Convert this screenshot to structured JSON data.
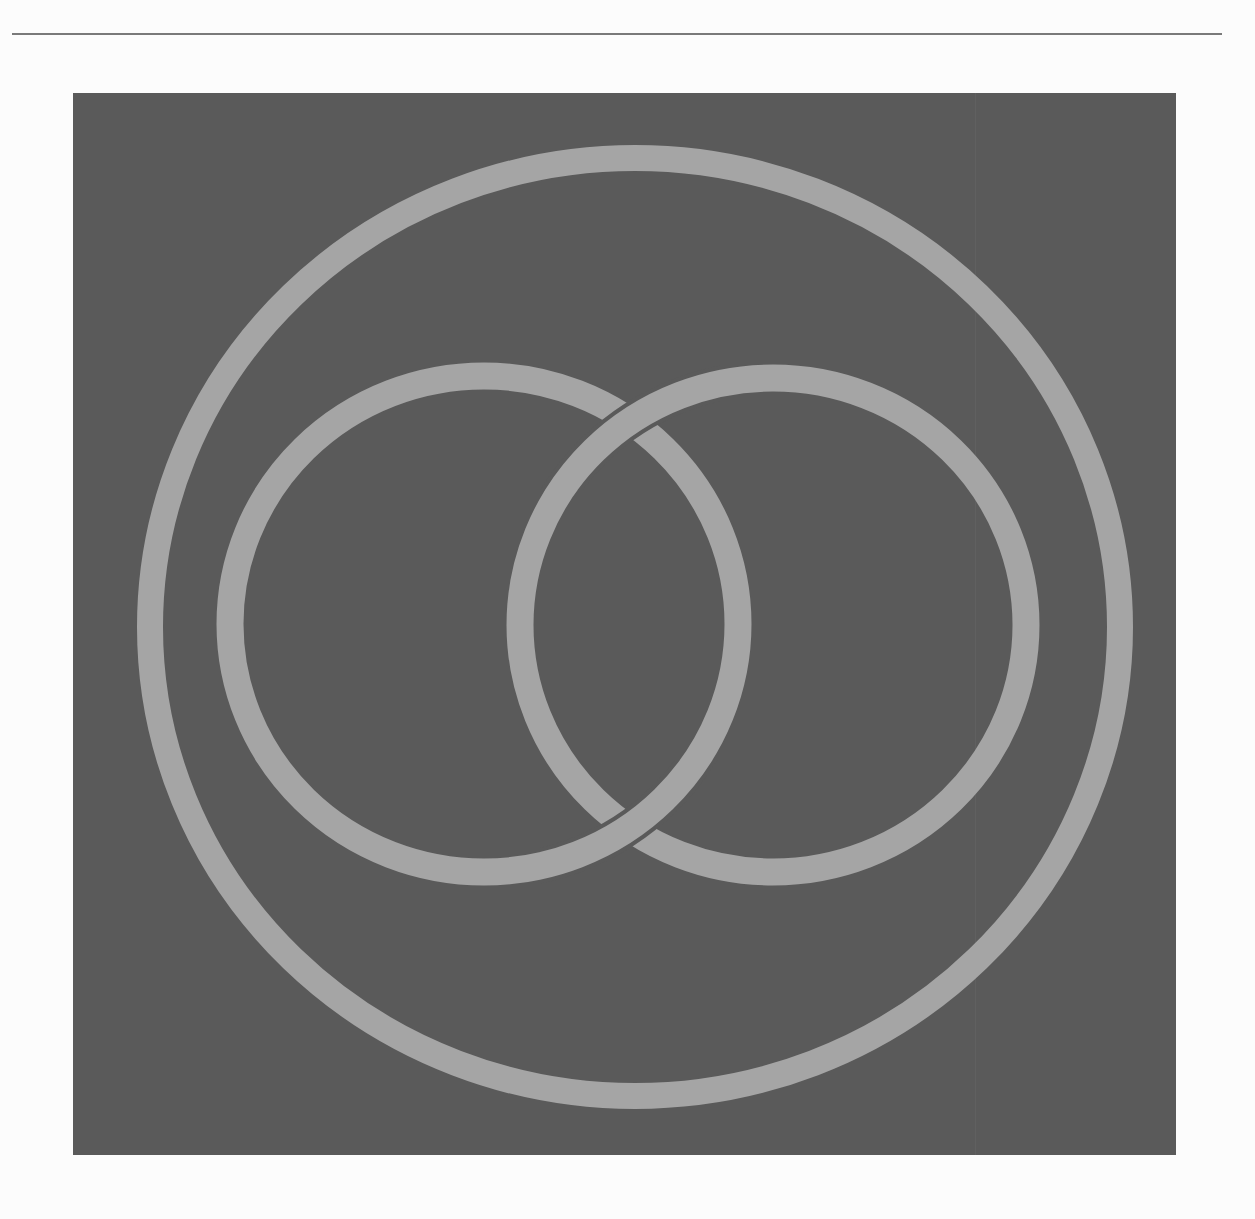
{
  "figure": {
    "colors": {
      "background": "#fcfcfc",
      "rule": "#7a7a7a",
      "panel": "#5a5a5a",
      "ring": "#a5a5a5"
    },
    "outer_ring": {
      "cx": 635,
      "cy": 627,
      "rx": 485,
      "ry": 469,
      "stroke": 26
    },
    "left_ring": {
      "cx": 484,
      "cy": 624,
      "rx": 254,
      "ry": 248,
      "stroke": 27
    },
    "right_ring": {
      "cx": 773,
      "cy": 625,
      "rx": 253,
      "ry": 247,
      "stroke": 27
    },
    "crossings": {
      "top": "right ring over left ring",
      "bottom": "left ring over right ring"
    }
  }
}
